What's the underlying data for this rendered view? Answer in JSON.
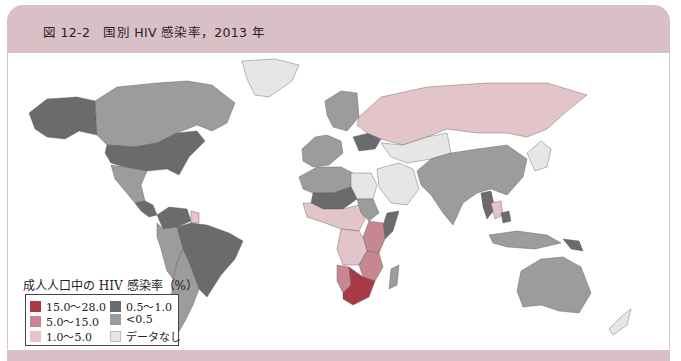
{
  "figure": {
    "title": "図 12-2　国別 HIV 感染率，2013 年",
    "header_color": "#d9bfc6"
  },
  "legend": {
    "title": "成人人口中の HIV 感染率（%）",
    "items": [
      {
        "label": "15.0～28.0",
        "color": "#a83a45"
      },
      {
        "label": "5.0～15.0",
        "color": "#c78790"
      },
      {
        "label": "1.0～5.0",
        "color": "#e3c4c9"
      },
      {
        "label": "0.5～1.0",
        "color": "#6b6b6d"
      },
      {
        "label": "<0.5",
        "color": "#9c9c9e"
      },
      {
        "label": "データなし",
        "color": "#e6e6e6"
      }
    ]
  },
  "map_data": {
    "type": "choropleth",
    "metric": "成人人口中の HIV 感染率（%）",
    "year": 2013,
    "regions": [
      {
        "name": "Alaska / USA",
        "category": "0.5～1.0"
      },
      {
        "name": "Canada",
        "category": "<0.5"
      },
      {
        "name": "Greenland",
        "category": "データなし"
      },
      {
        "name": "United States",
        "category": "0.5～1.0"
      },
      {
        "name": "Mexico",
        "category": "<0.5"
      },
      {
        "name": "Central America",
        "category": "0.5～1.0"
      },
      {
        "name": "Venezuela / Colombia",
        "category": "0.5～1.0"
      },
      {
        "name": "Guyana",
        "category": "1.0～5.0"
      },
      {
        "name": "Brazil",
        "category": "0.5～1.0"
      },
      {
        "name": "Andean South America",
        "category": "<0.5"
      },
      {
        "name": "Southern Cone",
        "category": "<0.5"
      },
      {
        "name": "Western Europe",
        "category": "<0.5"
      },
      {
        "name": "Scandinavia",
        "category": "<0.5"
      },
      {
        "name": "Ukraine / Belarus",
        "category": "0.5～1.0"
      },
      {
        "name": "Russia",
        "category": "1.0～5.0"
      },
      {
        "name": "Kazakhstan / Central Asia",
        "category": "データなし"
      },
      {
        "name": "North Africa",
        "category": "<0.5"
      },
      {
        "name": "Libya / Egypt region",
        "category": "データなし"
      },
      {
        "name": "Mali / Niger",
        "category": "0.5～1.0"
      },
      {
        "name": "Middle East",
        "category": "データなし"
      },
      {
        "name": "West & Central Africa",
        "category": "1.0～5.0"
      },
      {
        "name": "Sudan",
        "category": "<0.5"
      },
      {
        "name": "Somalia",
        "category": "0.5～1.0"
      },
      {
        "name": "Kenya / Uganda / Tanzania",
        "category": "5.0～15.0"
      },
      {
        "name": "Angola / DRC",
        "category": "1.0～5.0"
      },
      {
        "name": "Zambia / Mozambique / Malawi",
        "category": "5.0～15.0"
      },
      {
        "name": "Namibia",
        "category": "5.0～15.0"
      },
      {
        "name": "South Africa / Botswana / Zimbabwe",
        "category": "15.0～28.0"
      },
      {
        "name": "Madagascar",
        "category": "<0.5"
      },
      {
        "name": "China / India",
        "category": "<0.5"
      },
      {
        "name": "Myanmar",
        "category": "0.5～1.0"
      },
      {
        "name": "Thailand",
        "category": "1.0～5.0"
      },
      {
        "name": "Cambodia",
        "category": "0.5～1.0"
      },
      {
        "name": "Japan / Korea",
        "category": "データなし"
      },
      {
        "name": "Indonesia",
        "category": "<0.5"
      },
      {
        "name": "Papua New Guinea",
        "category": "0.5～1.0"
      },
      {
        "name": "Australia",
        "category": "<0.5"
      },
      {
        "name": "New Zealand",
        "category": "データなし"
      }
    ]
  }
}
